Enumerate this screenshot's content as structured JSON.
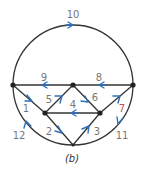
{
  "caption": "(b)",
  "colors": {
    "edge": "#333333",
    "arrow": "#2f6fb8",
    "label": "#777777",
    "label_accent": "#c0504d"
  },
  "nodes": [
    {
      "id": "left",
      "x": 13,
      "y": 85
    },
    {
      "id": "top",
      "x": 73,
      "y": 85
    },
    {
      "id": "right",
      "x": 133,
      "y": 85
    },
    {
      "id": "mid-left",
      "x": 45,
      "y": 113
    },
    {
      "id": "mid-right",
      "x": 100,
      "y": 113
    },
    {
      "id": "bottom",
      "x": 73,
      "y": 145
    }
  ],
  "edges": [
    {
      "label": "1",
      "from": "left",
      "to": "mid-left"
    },
    {
      "label": "2",
      "from": "mid-left",
      "to": "bottom"
    },
    {
      "label": "3",
      "from": "bottom",
      "to": "mid-right"
    },
    {
      "label": "4",
      "from": "mid-right",
      "to": "mid-left"
    },
    {
      "label": "5",
      "from": "mid-left",
      "to": "top"
    },
    {
      "label": "6",
      "from": "top",
      "to": "mid-right"
    },
    {
      "label": "7",
      "from": "mid-right",
      "to": "right"
    },
    {
      "label": "8",
      "from": "right",
      "to": "top"
    },
    {
      "label": "9",
      "from": "top",
      "to": "left"
    },
    {
      "label": "10",
      "from": "left",
      "to": "right",
      "path": "upper-arc"
    },
    {
      "label": "11",
      "from": "right",
      "to": "bottom",
      "path": "lower-right-arc"
    },
    {
      "label": "12",
      "from": "bottom",
      "to": "left",
      "path": "lower-left-arc"
    }
  ],
  "labels": {
    "e1": "1",
    "e2": "2",
    "e3": "3",
    "e4": "4",
    "e5": "5",
    "e6": "6",
    "e7": "7",
    "e8": "8",
    "e9": "9",
    "e10": "10",
    "e11": "11",
    "e12": "12"
  }
}
